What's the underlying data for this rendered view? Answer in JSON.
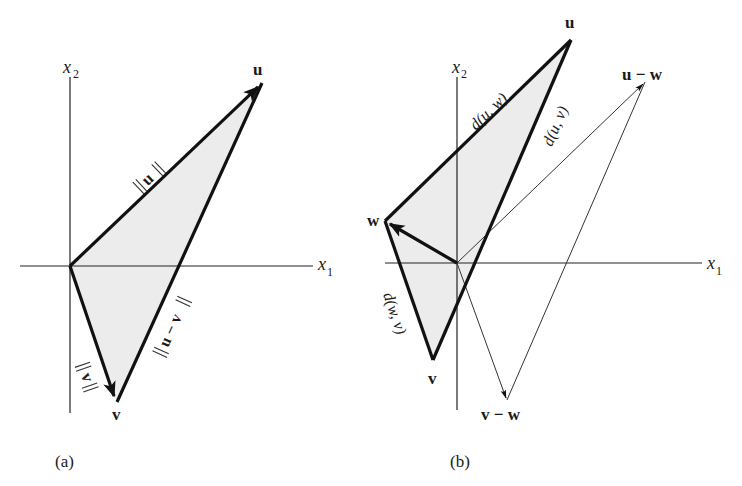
{
  "figure": {
    "panels": [
      {
        "id": "a",
        "caption": "(a)",
        "axes": {
          "x_label": "x",
          "x_sub": "1",
          "y_label": "x",
          "y_sub": "2"
        },
        "points": {
          "u": "u",
          "v": "v"
        },
        "edge_labels": {
          "norm_u": "u",
          "norm_v": "v",
          "norm_u_minus_v": "u − v"
        }
      },
      {
        "id": "b",
        "caption": "(b)",
        "axes": {
          "x_label": "x",
          "x_sub": "1",
          "y_label": "x",
          "y_sub": "2"
        },
        "points": {
          "u": "u",
          "v": "v",
          "w": "w",
          "u_minus_w": "u − w",
          "v_minus_w": "v − w"
        },
        "edge_labels": {
          "d_u_w": "d(u, w)",
          "d_u_v": "d(u, v)",
          "d_w_v": "d(w, v)"
        }
      }
    ],
    "colors": {
      "line": "#111111",
      "shade": "#ececec",
      "background": "#ffffff"
    }
  }
}
